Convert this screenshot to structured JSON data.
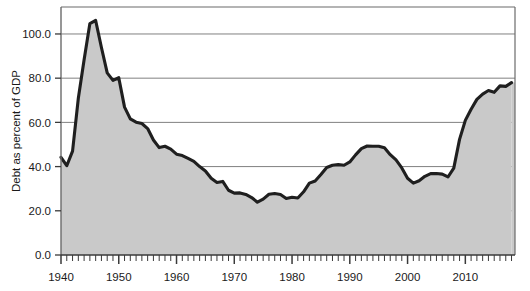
{
  "chart_data": {
    "type": "area",
    "title": "",
    "xlabel": "",
    "ylabel": "Debt as percent of GDP",
    "xlim": [
      1940,
      1918.5
    ],
    "ylim": [
      0.0,
      110.0
    ],
    "grid": true,
    "legend": "none",
    "x_tick_labels": [
      "1940",
      "1950",
      "1960",
      "1970",
      "1980",
      "1990",
      "2000",
      "2010"
    ],
    "x_tick_values": [
      1940,
      1950,
      1960,
      1970,
      1980,
      1990,
      2000,
      2010
    ],
    "x_minor_tick_interval": 1,
    "x_axis_end": 2018,
    "y_tick_labels": [
      "0.0",
      "20.0",
      "40.0",
      "60.0",
      "80.0",
      "100.0"
    ],
    "y_tick_values": [
      0.0,
      20.0,
      40.0,
      60.0,
      80.0,
      100.0
    ],
    "colors": {
      "line": "#1f1f1f",
      "fill": "#c9c9c9",
      "grid": "#808080",
      "axis": "#6b6b6b",
      "background": "#ffffff"
    },
    "x": [
      1940,
      1941,
      1942,
      1943,
      1944,
      1945,
      1946,
      1947,
      1948,
      1949,
      1950,
      1951,
      1952,
      1953,
      1954,
      1955,
      1956,
      1957,
      1958,
      1959,
      1960,
      1961,
      1962,
      1963,
      1964,
      1965,
      1966,
      1967,
      1968,
      1969,
      1970,
      1971,
      1972,
      1973,
      1974,
      1975,
      1976,
      1977,
      1978,
      1979,
      1980,
      1981,
      1982,
      1983,
      1984,
      1985,
      1986,
      1987,
      1988,
      1989,
      1990,
      1991,
      1992,
      1993,
      1994,
      1995,
      1996,
      1997,
      1998,
      1999,
      2000,
      2001,
      2002,
      2003,
      2004,
      2005,
      2006,
      2007,
      2008,
      2009,
      2010,
      2011,
      2012,
      2013,
      2014,
      2015,
      2016,
      2017,
      2018
    ],
    "values": [
      44.2,
      40.4,
      47.0,
      70.9,
      88.3,
      104.7,
      106.1,
      93.9,
      82.4,
      79.0,
      80.2,
      66.9,
      61.6,
      60.1,
      59.5,
      57.2,
      52.0,
      48.6,
      49.2,
      47.9,
      45.6,
      45.0,
      43.7,
      42.4,
      40.0,
      38.0,
      34.7,
      32.8,
      33.3,
      29.3,
      28.0,
      28.1,
      27.4,
      26.0,
      23.9,
      25.3,
      27.5,
      27.8,
      27.4,
      25.6,
      26.1,
      25.8,
      28.6,
      32.5,
      33.5,
      36.4,
      39.6,
      40.6,
      40.9,
      40.6,
      42.1,
      45.3,
      48.1,
      49.3,
      49.2,
      49.2,
      48.5,
      45.4,
      43.0,
      39.4,
      34.7,
      32.5,
      33.6,
      35.6,
      36.8,
      36.9,
      36.6,
      35.3,
      39.3,
      52.3,
      60.9,
      65.9,
      70.4,
      72.8,
      74.4,
      73.6,
      76.5,
      76.3,
      78.0
    ]
  }
}
